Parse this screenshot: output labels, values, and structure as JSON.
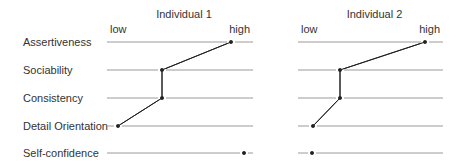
{
  "traits": [
    "Assertiveness",
    "Sociability",
    "Consistency",
    "Detail Orientation",
    "Self-confidence"
  ],
  "scale": {
    "low_label": "low",
    "high_label": "high"
  },
  "panels": [
    {
      "title": "Individual 1",
      "x0": 107,
      "x1": 253,
      "points_x": [
        231,
        162,
        162,
        118,
        244
      ],
      "connected_count": 4
    },
    {
      "title": "Individual 2",
      "x0": 298,
      "x1": 443,
      "points_x": [
        425,
        340,
        340,
        313,
        312
      ],
      "connected_count": 4
    }
  ],
  "row_y": [
    42,
    70,
    98,
    126,
    153
  ],
  "colors": {
    "text": "#333333",
    "line": "#9a9a9a",
    "profile": "#222222"
  },
  "chart_data": {
    "type": "line",
    "categories": [
      "Assertiveness",
      "Sociability",
      "Consistency",
      "Detail Orientation",
      "Self-confidence"
    ],
    "xlabel": "low → high",
    "ylabel": "",
    "xlim": [
      0,
      1
    ],
    "series": [
      {
        "name": "Individual 1",
        "values": [
          0.85,
          0.38,
          0.38,
          0.08,
          0.94
        ]
      },
      {
        "name": "Individual 2",
        "values": [
          0.88,
          0.29,
          0.29,
          0.1,
          0.1
        ]
      }
    ]
  }
}
